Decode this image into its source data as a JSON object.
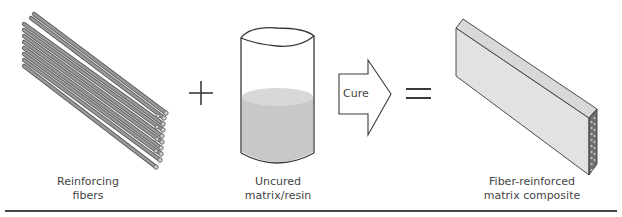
{
  "diagram": {
    "components": [
      {
        "id": "fibers",
        "label_line1": "Reinforcing",
        "label_line2": "fibers",
        "icon": "fiber-bundle-icon"
      },
      {
        "id": "resin",
        "label_line1": "Uncured",
        "label_line2": "matrix/resin",
        "icon": "resin-cylinder-icon"
      },
      {
        "id": "composite",
        "label_line1": "Fiber-reinforced",
        "label_line2": "matrix composite",
        "icon": "composite-block-icon"
      }
    ],
    "operators": {
      "plus": "+",
      "equals": "=",
      "process_arrow_label": "Cure"
    },
    "colors": {
      "outline": "#3a3a3a",
      "fiber": "#8a8a8a",
      "resin_fill": "#c8c8c8",
      "resin_top": "#d6d6d6",
      "composite_face": "#e2e2e2",
      "composite_top": "#d8d8d8",
      "composite_end": "#6e6e6e"
    }
  }
}
